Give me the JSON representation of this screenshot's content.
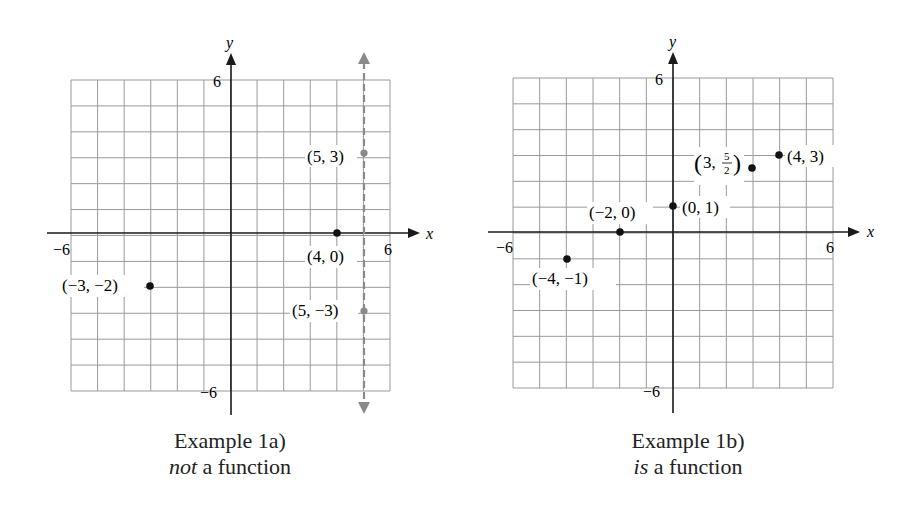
{
  "chart_data": [
    {
      "type": "scatter",
      "title": "Example 1a)",
      "subtitle_emphasis": "not",
      "subtitle_rest": " a function",
      "xlabel": "x",
      "ylabel": "y",
      "xlim": [
        -6,
        6
      ],
      "ylim": [
        -6,
        6
      ],
      "grid": true,
      "x_ticks": [
        -6,
        6
      ],
      "y_ticks": [
        6,
        -6
      ],
      "tick_labels": {
        "x_min": "−6",
        "x_max": "6",
        "y_max": "6",
        "y_min": "−6"
      },
      "points": [
        {
          "x": -3,
          "y": -2,
          "label": "(−3, −2)",
          "color": "#111111",
          "label_side": "left"
        },
        {
          "x": 4,
          "y": 0,
          "label": "(4, 0)",
          "color": "#111111",
          "label_side": "below"
        },
        {
          "x": 5,
          "y": 3,
          "label": "(5, 3)",
          "color": "#8a8a8a",
          "label_side": "left"
        },
        {
          "x": 5,
          "y": -3,
          "label": "(5, −3)",
          "color": "#8a8a8a",
          "label_side": "left"
        }
      ],
      "annotations": [
        {
          "type": "vertical-line-test",
          "x": 5,
          "style": "dashed",
          "color": "#8a8a8a",
          "arrows": "both"
        }
      ]
    },
    {
      "type": "scatter",
      "title": "Example 1b)",
      "subtitle_emphasis": "is",
      "subtitle_rest": " a function",
      "xlabel": "x",
      "ylabel": "y",
      "xlim": [
        -6,
        6
      ],
      "ylim": [
        -6,
        6
      ],
      "grid": true,
      "x_ticks": [
        -6,
        6
      ],
      "y_ticks": [
        6,
        -6
      ],
      "tick_labels": {
        "x_min": "−6",
        "x_max": "6",
        "y_max": "6",
        "y_min": "−6"
      },
      "points": [
        {
          "x": -4,
          "y": -1,
          "label": "(−4, −1)",
          "color": "#111111",
          "label_side": "below"
        },
        {
          "x": -2,
          "y": 0,
          "label": "(−2, 0)",
          "color": "#111111",
          "label_side": "above"
        },
        {
          "x": 0,
          "y": 1,
          "label": "(0, 1)",
          "color": "#111111",
          "label_side": "right"
        },
        {
          "x": 3,
          "y": 2.5,
          "label": "(3, 5/2)",
          "label_num": "5",
          "label_den": "2",
          "label_pre": "3, ",
          "color": "#111111",
          "label_side": "left"
        },
        {
          "x": 4,
          "y": 3,
          "label": "(4, 3)",
          "color": "#111111",
          "label_side": "right"
        }
      ],
      "annotations": []
    }
  ],
  "colors": {
    "grid": "#9a9a9a",
    "axis": "#1a1a1a",
    "highlight": "#8a8a8a"
  }
}
